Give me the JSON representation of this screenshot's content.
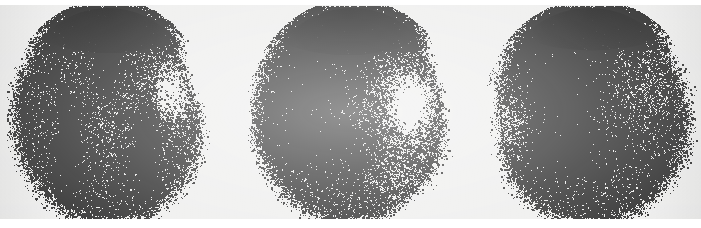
{
  "image": {
    "kind": "scintigram-film",
    "modality_label": "radionuclide brain scan",
    "width": 701,
    "height": 228,
    "background_color": "#ececeb",
    "margin_color": "#ffffff",
    "dot_color": "#141414",
    "caption": "",
    "panel_count": 3
  },
  "panels": [
    {
      "name": "panel-1",
      "view_label": "",
      "cx": 108,
      "cy": 116,
      "rx": 96,
      "ry": 108,
      "clipped_left": true,
      "density": 0.44,
      "seed": 1717,
      "features": [
        {
          "type": "superior-band",
          "cx": 108,
          "cy": 18,
          "rx": 74,
          "ry": 26,
          "strength": 1.0
        },
        {
          "type": "midline-vertical",
          "cx": 106,
          "cy": 58,
          "rx": 9,
          "ry": 46,
          "strength": 0.85
        },
        {
          "type": "left-lateral-band",
          "cx": 68,
          "cy": 150,
          "rx": 11,
          "ry": 48,
          "strength": 0.8
        },
        {
          "type": "right-lateral-band",
          "cx": 146,
          "cy": 152,
          "rx": 12,
          "ry": 50,
          "strength": 0.85
        },
        {
          "type": "cold-area-right",
          "cx": 172,
          "cy": 92,
          "rx": 36,
          "ry": 48,
          "strength": -0.55
        },
        {
          "type": "cold-area-center",
          "cx": 108,
          "cy": 118,
          "rx": 22,
          "ry": 34,
          "strength": -0.25
        }
      ]
    },
    {
      "name": "panel-2",
      "view_label": "",
      "cx": 352,
      "cy": 116,
      "rx": 98,
      "ry": 108,
      "clipped_left": false,
      "density": 0.44,
      "seed": 4231,
      "features": [
        {
          "type": "superior-band",
          "cx": 348,
          "cy": 20,
          "rx": 76,
          "ry": 26,
          "strength": 1.0
        },
        {
          "type": "upper-left-hot",
          "cx": 308,
          "cy": 72,
          "rx": 42,
          "ry": 34,
          "strength": 0.6
        },
        {
          "type": "mid-left-hot",
          "cx": 300,
          "cy": 132,
          "rx": 34,
          "ry": 36,
          "strength": 0.72
        },
        {
          "type": "central-hot",
          "cx": 338,
          "cy": 148,
          "rx": 26,
          "ry": 24,
          "strength": 0.5
        },
        {
          "type": "cold-area-right",
          "cx": 410,
          "cy": 104,
          "rx": 42,
          "ry": 56,
          "strength": -0.62
        },
        {
          "type": "cold-inferior-right",
          "cx": 392,
          "cy": 182,
          "rx": 40,
          "ry": 34,
          "strength": -0.3
        }
      ]
    },
    {
      "name": "panel-3",
      "view_label": "",
      "cx": 590,
      "cy": 116,
      "rx": 100,
      "ry": 108,
      "clipped_left": false,
      "density": 0.46,
      "seed": 9003,
      "features": [
        {
          "type": "superior-band",
          "cx": 592,
          "cy": 18,
          "rx": 76,
          "ry": 24,
          "strength": 1.0
        },
        {
          "type": "upper-left-hot",
          "cx": 552,
          "cy": 70,
          "rx": 44,
          "ry": 40,
          "strength": 0.68
        },
        {
          "type": "mid-left-hot",
          "cx": 556,
          "cy": 134,
          "rx": 34,
          "ry": 42,
          "strength": 0.6
        },
        {
          "type": "central-hot",
          "cx": 590,
          "cy": 150,
          "rx": 40,
          "ry": 20,
          "strength": 0.45
        },
        {
          "type": "cold-area-left",
          "cx": 512,
          "cy": 118,
          "rx": 26,
          "ry": 48,
          "strength": -0.45
        },
        {
          "type": "cold-area-right",
          "cx": 650,
          "cy": 86,
          "rx": 34,
          "ry": 44,
          "strength": -0.28
        }
      ]
    }
  ]
}
